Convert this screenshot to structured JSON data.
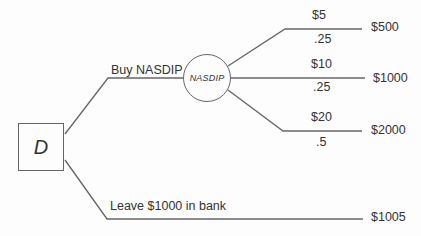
{
  "diagram": {
    "type": "decision-tree",
    "colors": {
      "line": "#666666",
      "text": "#333333",
      "bg": "#fdfdfd"
    },
    "decision_node": {
      "label": "D"
    },
    "chance_node": {
      "label": "NASDIP"
    },
    "alternatives": {
      "buy": {
        "label": "Buy NASDIP"
      },
      "bank": {
        "label": "Leave $1000 in bank",
        "payoff": "$1005"
      }
    },
    "chance_outcomes": [
      {
        "price": "$5",
        "probability": ".25",
        "payoff": "$500"
      },
      {
        "price": "$10",
        "probability": ".25",
        "payoff": "$1000"
      },
      {
        "price": "$20",
        "probability": ".5",
        "payoff": "$2000"
      }
    ]
  }
}
